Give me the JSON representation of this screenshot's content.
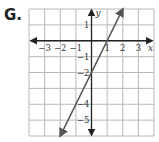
{
  "problem_label": "G.",
  "chart_data": {
    "type": "line",
    "title": "",
    "xlabel": "x",
    "ylabel": "y",
    "xlim": [
      -4,
      4
    ],
    "ylim": [
      -6,
      2
    ],
    "grid": true,
    "x_tick_labels": [
      "-3",
      "-2",
      "-1",
      "1",
      "2",
      "3"
    ],
    "y_tick_labels": [
      "1",
      "-1",
      "-2",
      "-4",
      "-5"
    ],
    "series": [
      {
        "name": "line",
        "equation": "y = 2x - 2",
        "slope": 2,
        "intercept": -2,
        "x": [
          -2,
          -1,
          0,
          1,
          2
        ],
        "y": [
          -6,
          -4,
          -2,
          0,
          2
        ],
        "arrows_both_ends": true,
        "color": "#555555"
      }
    ]
  },
  "colors": {
    "grid": "#b8b8b8",
    "axis": "#222222",
    "line": "#555555"
  }
}
